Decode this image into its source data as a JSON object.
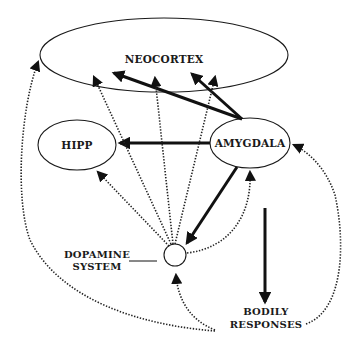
{
  "diagram": {
    "nodes": {
      "neocortex": {
        "label": "NEOCORTEX"
      },
      "hipp": {
        "label": "HIPP"
      },
      "amygdala": {
        "label": "AMYGDALA"
      },
      "dopamine": {
        "label_line1": "DOPAMINE",
        "label_line2": "SYSTEM"
      },
      "bodily": {
        "label_line1": "BODILY",
        "label_line2": "RESPONSES"
      }
    },
    "edges": [
      {
        "from": "amygdala",
        "to": "neocortex",
        "style": "solid",
        "count": 2
      },
      {
        "from": "amygdala",
        "to": "hipp",
        "style": "solid"
      },
      {
        "from": "amygdala",
        "to": "dopamine",
        "style": "solid"
      },
      {
        "from": "amygdala",
        "to": "bodily_responses",
        "style": "solid"
      },
      {
        "from": "dopamine",
        "to": "neocortex",
        "style": "dotted",
        "count": 3
      },
      {
        "from": "dopamine",
        "to": "hipp",
        "style": "dotted"
      },
      {
        "from": "dopamine",
        "to": "amygdala",
        "style": "dotted"
      },
      {
        "from": "bodily_responses",
        "to": "neocortex",
        "style": "dotted"
      },
      {
        "from": "bodily_responses",
        "to": "amygdala",
        "style": "dotted"
      },
      {
        "from": "bodily_responses",
        "to": "dopamine",
        "style": "dotted"
      }
    ]
  }
}
